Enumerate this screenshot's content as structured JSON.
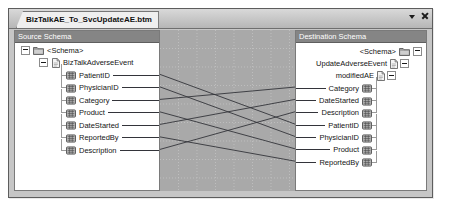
{
  "window": {
    "tab_label": "BizTalkAE_To_SvcUpdateAE.btm",
    "dropdown_icon": "chevron-down-icon",
    "close_icon": "close-icon"
  },
  "source_panel": {
    "title": "Source Schema",
    "nodes": [
      {
        "label": "<Schema>",
        "level": 0,
        "icon": "folder-icon",
        "expander": "minus"
      },
      {
        "label": "BizTalkAdverseEvent",
        "level": 1,
        "icon": "document-icon",
        "expander": "minus"
      },
      {
        "label": "PatientID",
        "level": 2,
        "icon": "field-icon",
        "expander": "none"
      },
      {
        "label": "PhysicianID",
        "level": 2,
        "icon": "field-icon",
        "expander": "none"
      },
      {
        "label": "Category",
        "level": 2,
        "icon": "field-icon",
        "expander": "none"
      },
      {
        "label": "Product",
        "level": 2,
        "icon": "field-icon",
        "expander": "none"
      },
      {
        "label": "DateStarted",
        "level": 2,
        "icon": "field-icon",
        "expander": "none"
      },
      {
        "label": "ReportedBy",
        "level": 2,
        "icon": "field-icon",
        "expander": "none"
      },
      {
        "label": "Description",
        "level": 2,
        "icon": "field-icon",
        "expander": "none"
      }
    ]
  },
  "destination_panel": {
    "title": "Destination Schema",
    "nodes": [
      {
        "label": "<Schema>",
        "level": 0,
        "icon": "folder-icon",
        "expander": "minus"
      },
      {
        "label": "UpdateAdverseEvent",
        "level": 1,
        "icon": "document-icon",
        "expander": "minus"
      },
      {
        "label": "modifiedAE",
        "level": 2,
        "icon": "document-icon",
        "expander": "minus"
      },
      {
        "label": "Category",
        "level": 3,
        "icon": "field-icon",
        "expander": "none"
      },
      {
        "label": "DateStarted",
        "level": 3,
        "icon": "field-icon",
        "expander": "none"
      },
      {
        "label": "Description",
        "level": 3,
        "icon": "field-icon",
        "expander": "none"
      },
      {
        "label": "PatientID",
        "level": 3,
        "icon": "field-icon",
        "expander": "none"
      },
      {
        "label": "PhysicianID",
        "level": 3,
        "icon": "field-icon",
        "expander": "none"
      },
      {
        "label": "Product",
        "level": 3,
        "icon": "field-icon",
        "expander": "none"
      },
      {
        "label": "ReportedBy",
        "level": 3,
        "icon": "field-icon",
        "expander": "none"
      }
    ]
  },
  "map_grid": {
    "width": 135,
    "height": 160,
    "spacing": 18.5,
    "background": "#a9a9a9",
    "gridline_color": "#c4c4c4",
    "link_color": "#33343a"
  },
  "links": [
    {
      "from": "PatientID",
      "to": "PatientID",
      "y1": 44.4,
      "y2": 94.1
    },
    {
      "from": "PhysicianID",
      "to": "PhysicianID",
      "y1": 56.9,
      "y2": 106.45
    },
    {
      "from": "Category",
      "to": "Category",
      "y1": 69.4,
      "y2": 57.05
    },
    {
      "from": "Product",
      "to": "Product",
      "y1": 81.9,
      "y2": 118.8
    },
    {
      "from": "DateStarted",
      "to": "DateStarted",
      "y1": 94.4,
      "y2": 69.4
    },
    {
      "from": "ReportedBy",
      "to": "ReportedBy",
      "y1": 106.9,
      "y2": 131.15
    },
    {
      "from": "Description",
      "to": "Description",
      "y1": 119.4,
      "y2": 81.75
    }
  ],
  "colors": {
    "panel_header": "#858585",
    "panel_header_text": "#ffffff",
    "tree_background": "#ffffff",
    "window_chrome": "#c6c6c6"
  }
}
